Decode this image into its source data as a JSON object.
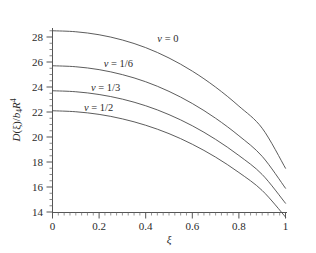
{
  "chart_data": {
    "type": "line",
    "title": "",
    "subtitle": "",
    "xlabel": "ξ",
    "ylabel": "D(ξ)/b₄R⁴",
    "xlim": [
      0,
      1
    ],
    "ylim": [
      13.2,
      29.2
    ],
    "grid": false,
    "legend_position": "inline-curve-labels",
    "xticks": [
      0,
      0.2,
      0.4,
      0.6,
      0.8,
      1
    ],
    "xtick_labels": [
      "0",
      "0.2",
      "0.4",
      "0.6",
      "0.8",
      "1"
    ],
    "yticks": [
      14,
      16,
      18,
      20,
      22,
      24,
      26,
      28
    ],
    "ytick_labels": [
      "14",
      "16",
      "18",
      "20",
      "22",
      "24",
      "26",
      "28"
    ],
    "x": [
      0,
      0.1,
      0.2,
      0.3,
      0.4,
      0.5,
      0.6,
      0.7,
      0.8,
      0.9,
      1
    ],
    "series": [
      {
        "name": "v = 0",
        "label": "v = 0",
        "color": "#4a4a4a",
        "values": [
          28.5,
          28.42,
          28.18,
          27.76,
          27.15,
          26.32,
          25.27,
          23.99,
          22.47,
          20.7,
          17.5
        ]
      },
      {
        "name": "v = 1/6",
        "label": "v = 1/6",
        "color": "#4a4a4a",
        "values": [
          25.7,
          25.62,
          25.39,
          24.99,
          24.42,
          23.65,
          22.68,
          21.5,
          20.1,
          18.45,
          15.9
        ]
      },
      {
        "name": "v = 1/3",
        "label": "v = 1/3",
        "color": "#4a4a4a",
        "values": [
          23.7,
          23.62,
          23.4,
          23.03,
          22.5,
          21.79,
          20.9,
          19.81,
          18.52,
          17.0,
          14.7
        ]
      },
      {
        "name": "v = 1/2",
        "label": "v = 1/2",
        "color": "#4a4a4a",
        "values": [
          22.1,
          22.02,
          21.81,
          21.45,
          20.94,
          20.27,
          19.42,
          18.39,
          17.16,
          15.72,
          13.6
        ]
      }
    ],
    "annotations": [
      {
        "text": "v = 0",
        "x": 0.45,
        "y": 27.6
      },
      {
        "text": "v = 1/6",
        "x": 0.22,
        "y": 25.6
      },
      {
        "text": "v = 1/3",
        "x": 0.165,
        "y": 23.65
      },
      {
        "text": "v = 1/2",
        "x": 0.135,
        "y": 22.05
      }
    ]
  },
  "axes": {
    "ylabel_parts": {
      "d": "D",
      "xi_paren": "(ξ)/",
      "b": "b",
      "b_sub": "4",
      "r": "R",
      "r_sup": "4"
    },
    "xlabel": "ξ"
  },
  "colors": {
    "curve": "#4a4a4a",
    "axis": "#555555",
    "text": "#2b2b2b",
    "background": "#ffffff"
  }
}
